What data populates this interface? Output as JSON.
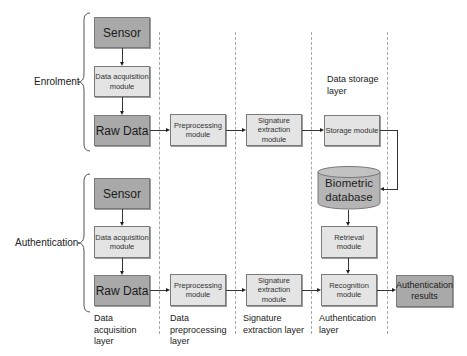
{
  "phases": {
    "enrolment": "Enrolment",
    "authentication": "Authentication"
  },
  "enrolment": {
    "sensor": "Sensor",
    "data_acquisition": "Data acquisition module",
    "raw_data": "Raw Data",
    "preprocessing": "Preprocessing module",
    "signature_extraction": "Signature extraction module",
    "storage": "Storage module"
  },
  "storage": {
    "layer_label": "Data storage layer",
    "database": "Biometric database"
  },
  "authentication": {
    "sensor": "Sensor",
    "data_acquisition": "Data acquisition module",
    "raw_data": "Raw Data",
    "preprocessing": "Preprocessing module",
    "signature_extraction": "Signature extraction module",
    "retrieval": "Retrieval module",
    "recognition": "Recognition module",
    "results": "Authentication results"
  },
  "layers": {
    "data_acquisition": "Data acquisition layer",
    "data_preprocessing": "Data preprocessing layer",
    "signature_extraction": "Signature extraction layer",
    "authentication": "Authentication layer"
  },
  "colors": {
    "dark_box": "#a9a9a9",
    "light_box": "#e4e4e4",
    "database": "#b5b5b5",
    "dashed_divider": "#a8a8a8"
  }
}
